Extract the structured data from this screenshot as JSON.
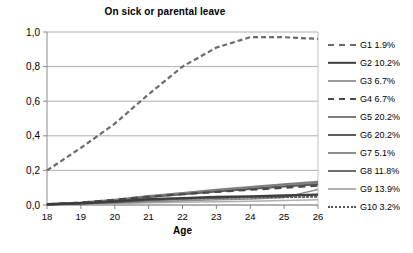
{
  "chart_data": {
    "type": "line",
    "title": "On sick or parental leave",
    "xlabel": "Age",
    "ylabel": "",
    "xlim": [
      18,
      26
    ],
    "ylim": [
      0.0,
      1.0
    ],
    "grid": true,
    "legend_position": "right",
    "x": [
      18,
      19,
      20,
      21,
      22,
      23,
      24,
      25,
      26
    ],
    "xticks": [
      "18",
      "19",
      "20",
      "21",
      "22",
      "23",
      "24",
      "25",
      "26"
    ],
    "yticks": [
      "0,0",
      "0,2",
      "0,4",
      "0,6",
      "0,8",
      "1,0"
    ],
    "ytick_values": [
      0.0,
      0.2,
      0.4,
      0.6,
      0.8,
      1.0
    ],
    "series": [
      {
        "name": "G1 1.9%",
        "key": "G1",
        "share": "1.9%",
        "style": "dashed",
        "color": "#6b6b6b",
        "width": 2.2,
        "dash": "5,3",
        "values": [
          0.2,
          0.33,
          0.47,
          0.64,
          0.8,
          0.91,
          0.97,
          0.97,
          0.96
        ]
      },
      {
        "name": "G2 10.2%",
        "key": "G2",
        "share": "10.2%",
        "style": "solid",
        "color": "#3d3d3d",
        "width": 2.4,
        "dash": "",
        "values": [
          0.004,
          0.01,
          0.02,
          0.033,
          0.04,
          0.046,
          0.05,
          0.055,
          0.06
        ]
      },
      {
        "name": "G3 6.7%",
        "key": "G3",
        "share": "6.7%",
        "style": "solid",
        "color": "#9a9a9a",
        "width": 1.5,
        "dash": "",
        "values": [
          0.003,
          0.012,
          0.026,
          0.045,
          0.063,
          0.08,
          0.096,
          0.112,
          0.128
        ]
      },
      {
        "name": "G4 6.7%",
        "key": "G4",
        "share": "6.7%",
        "style": "dashed-long",
        "color": "#4a4a4a",
        "width": 2.2,
        "dash": "7,5",
        "values": [
          0.004,
          0.014,
          0.03,
          0.048,
          0.062,
          0.076,
          0.088,
          0.1,
          0.112
        ]
      },
      {
        "name": "G5 20.2%",
        "key": "G5",
        "share": "20.2%",
        "style": "solid",
        "color": "#7d7d7d",
        "width": 2.0,
        "dash": "",
        "values": [
          0.004,
          0.014,
          0.031,
          0.052,
          0.07,
          0.088,
          0.104,
          0.12,
          0.134
        ]
      },
      {
        "name": "G6 20.2%",
        "key": "G6",
        "share": "20.2%",
        "style": "solid",
        "color": "#5c5c5c",
        "width": 2.0,
        "dash": "",
        "values": [
          0.003,
          0.012,
          0.027,
          0.046,
          0.062,
          0.078,
          0.092,
          0.107,
          0.12
        ]
      },
      {
        "name": "G7 5.1%",
        "key": "G7",
        "share": "5.1%",
        "style": "solid",
        "color": "#8e8e8e",
        "width": 1.5,
        "dash": "",
        "values": [
          0.002,
          0.006,
          0.012,
          0.018,
          0.024,
          0.03,
          0.034,
          0.044,
          0.09
        ]
      },
      {
        "name": "G8 11.8%",
        "key": "G8",
        "share": "11.8%",
        "style": "solid",
        "color": "#6f6f6f",
        "width": 1.8,
        "dash": "",
        "values": [
          0.002,
          0.008,
          0.016,
          0.026,
          0.034,
          0.041,
          0.047,
          0.053,
          0.06
        ]
      },
      {
        "name": "G9 13.9%",
        "key": "G9",
        "share": "13.9%",
        "style": "solid",
        "color": "#b0b0b0",
        "width": 1.4,
        "dash": "",
        "values": [
          0.001,
          0.004,
          0.008,
          0.012,
          0.016,
          0.019,
          0.022,
          0.026,
          0.03
        ]
      },
      {
        "name": "G10 3.2%",
        "key": "G10",
        "share": "3.2%",
        "style": "dotted",
        "color": "#555555",
        "width": 1.8,
        "dash": "1.5,2.5",
        "values": [
          0.003,
          0.01,
          0.02,
          0.03,
          0.036,
          0.04,
          0.043,
          0.045,
          0.047
        ]
      }
    ]
  }
}
